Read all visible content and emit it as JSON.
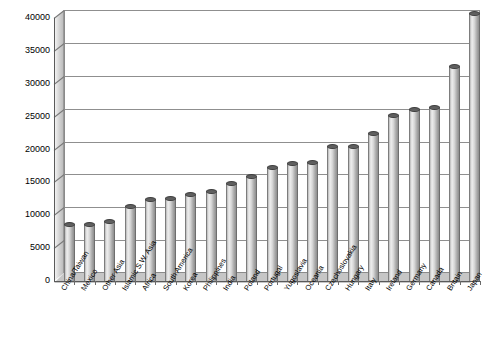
{
  "chart_data": {
    "type": "bar",
    "title": "",
    "subtitle": "",
    "xlabel": "",
    "ylabel": "",
    "ylim": [
      0,
      40000
    ],
    "ytick_step": 5000,
    "yticks": [
      "0",
      "5000",
      "10000",
      "15000",
      "20000",
      "25000",
      "30000",
      "35000",
      "40000"
    ],
    "grid": true,
    "legend": false,
    "orientation": "vertical",
    "style": "3d-cylinder",
    "categories": [
      "China/Taiwan",
      "Mexico",
      "Other Asia",
      "Islamic S.W. Asia",
      "Africa",
      "South America",
      "Korea",
      "Philippines",
      "India",
      "Poland",
      "Portugal",
      "Yugoslavia",
      "Oceania",
      "Czechoslovakia",
      "Hungary",
      "Italy",
      "Ireland",
      "Germany",
      "Canada",
      "Britain",
      "Japan"
    ],
    "values": [
      8000,
      7900,
      8400,
      10700,
      11800,
      11900,
      12600,
      13000,
      14200,
      15200,
      16600,
      17200,
      17400,
      19900,
      19900,
      21800,
      24500,
      25500,
      25700,
      32000,
      40000
    ],
    "colors": {
      "bar_light": "#efefef",
      "bar_mid": "#d8d8d8",
      "bar_dark": "#8e8e8e",
      "bar_cap": "#5f5f5f",
      "gridline": "#8f8f8f",
      "axis": "#5a5a5a",
      "wall": "#d2d2d2",
      "floor": "#c6c6c6",
      "background": "#ffffff",
      "text": "#000000"
    }
  }
}
